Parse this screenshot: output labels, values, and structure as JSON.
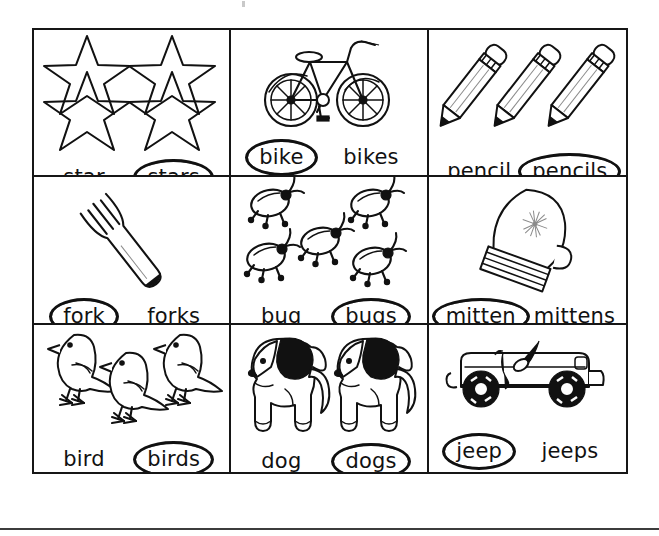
{
  "worksheet": {
    "type": "singular-plural-picture-cards",
    "rows": 3,
    "columns": 3,
    "cells": [
      {
        "id": "cell-star",
        "picture": "stars",
        "picture_count": 4,
        "left_word": "star",
        "right_word": "stars",
        "circled_word": "stars",
        "circled_position": "right"
      },
      {
        "id": "cell-bike",
        "picture": "bicycle",
        "picture_count": 1,
        "left_word": "bike",
        "right_word": "bikes",
        "circled_word": "bike",
        "circled_position": "left"
      },
      {
        "id": "cell-pencil",
        "picture": "pencils",
        "picture_count": 3,
        "left_word": "pencil",
        "right_word": "pencils",
        "circled_word": "pencils",
        "circled_position": "right"
      },
      {
        "id": "cell-fork",
        "picture": "fork",
        "picture_count": 1,
        "left_word": "fork",
        "right_word": "forks",
        "circled_word": "fork",
        "circled_position": "left"
      },
      {
        "id": "cell-bug",
        "picture": "bugs",
        "picture_count": 5,
        "left_word": "bug",
        "right_word": "bugs",
        "circled_word": "bugs",
        "circled_position": "right"
      },
      {
        "id": "cell-mitten",
        "picture": "mitten",
        "picture_count": 1,
        "left_word": "mitten",
        "right_word": "mittens",
        "circled_word": "mitten",
        "circled_position": "left"
      },
      {
        "id": "cell-bird",
        "picture": "birds",
        "picture_count": 3,
        "left_word": "bird",
        "right_word": "birds",
        "circled_word": "birds",
        "circled_position": "right"
      },
      {
        "id": "cell-dog",
        "picture": "dogs",
        "picture_count": 2,
        "left_word": "dog",
        "right_word": "dogs",
        "circled_word": "dogs",
        "circled_position": "right"
      },
      {
        "id": "cell-jeep",
        "picture": "jeep",
        "picture_count": 1,
        "left_word": "jeep",
        "right_word": "jeeps",
        "circled_word": "jeep",
        "circled_position": "left"
      }
    ]
  },
  "colors": {
    "ink": "#111111",
    "paper": "#ffffff",
    "rule": "#3c3c3c"
  }
}
